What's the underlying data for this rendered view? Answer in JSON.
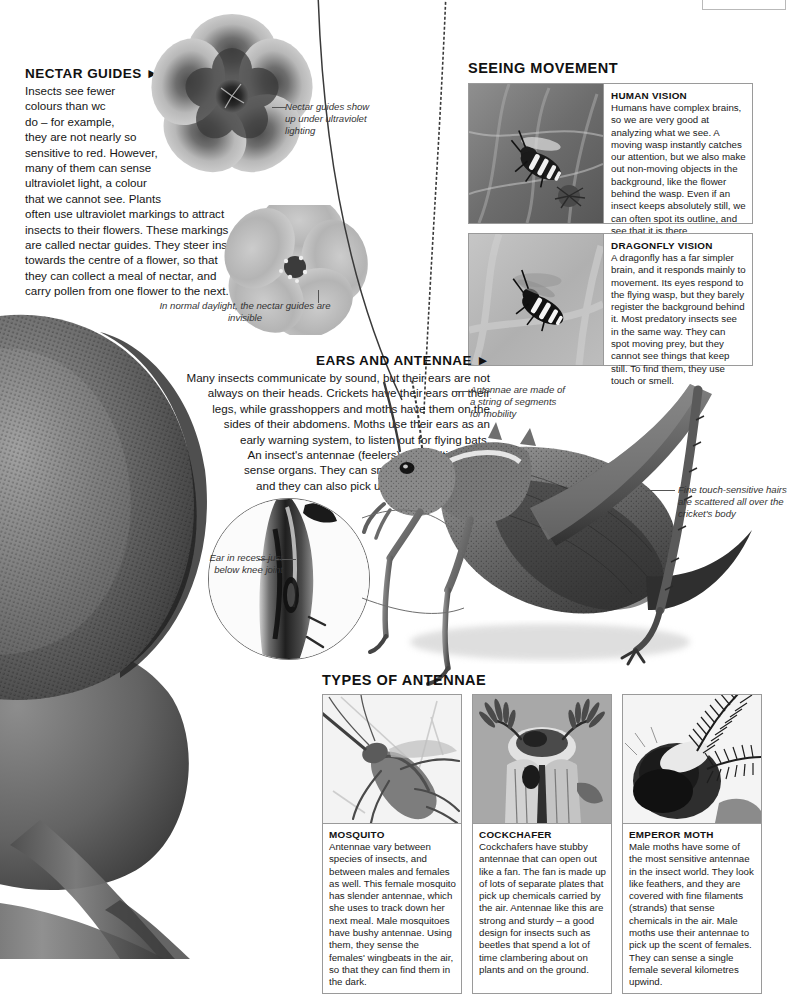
{
  "nectar_guides": {
    "heading": "NECTAR GUIDES ►",
    "body_lines": [
      "Insects see fewer",
      "colours than wc",
      "do – for example,",
      "they are not nearly so",
      "sensitive to red. However,",
      "many of them can sense",
      "ultraviolet light, a colour",
      "that we cannot see. Plants",
      "often use ultraviolet markings to attract",
      "insects to their flowers. These markings",
      "are called nectar guides. They steer insects",
      "towards the centre of a flower, so that",
      "they can collect a meal of nectar, and",
      "carry pollen from one flower to the next."
    ],
    "uv_caption": "Nectar guides show up under ultraviolet lighting",
    "daylight_caption": "In normal daylight, the nectar guides are invisible"
  },
  "seeing_movement": {
    "title": "SEEING MOVEMENT",
    "panels": [
      {
        "title": "HUMAN VISION",
        "photo_name": "wasp-on-plant-photo",
        "body": "Humans have complex brains, so we are very good at analyzing what we see. A moving wasp instantly catches our attention, but we also make out non-moving objects in the background, like the flower behind the wasp. Even if an insect keeps absolutely still, we can often spot its outline, and see that it is there."
      },
      {
        "title": "DRAGONFLY VISION",
        "photo_name": "wasp-blurred-background-photo",
        "body": "A dragonfly has a far simpler brain, and it responds mainly to movement. Its eyes respond to the flying wasp, but they barely register the background behind it. Most predatory insects see in the same way. They can spot moving prey, but they cannot see things that keep still. To find them, they use touch or smell."
      }
    ]
  },
  "ears_and_antennae": {
    "heading": "EARS AND ANTENNAE ►",
    "body_lines": [
      "Many insects communicate by sound, but their ears are not",
      "always on their heads. Crickets have their ears on their",
      "legs, while grasshoppers and moths have them on the",
      "sides of their abdomens. Moths use their ears as an",
      "early warning system, to listen out for flying bats.",
      "An insect's antennae (feelers) are multipurpose",
      "sense organs. They can smell, touch, and taste,",
      "and they can also pick up vibrations in the air."
    ]
  },
  "annotations": {
    "antennae_note": "Antennae are made of a string of segments for mobility",
    "hairs_note": "Fine touch-sensitive hairs are scattered all over the cricket's body",
    "ear_note": "Ear in recess just below knee joint"
  },
  "types_of_antennae": {
    "title": "TYPES OF ANTENNAE",
    "cards": [
      {
        "title": "MOSQUITO",
        "photo_name": "mosquito-head-photo",
        "body": "Antennae vary between species of insects, and between males and females as well. This female mosquito has slender antennae, which she uses to track down her next meal. Male mosquitoes have bushy antennae. Using them, they sense the females' wingbeats in the air, so that they can find them in the dark."
      },
      {
        "title": "COCKCHAFER",
        "photo_name": "cockchafer-head-photo",
        "body": "Cockchafers have stubby antennae that can open out like a fan. The fan is made up of lots of separate plates that pick up chemicals carried by the air. Antennae like this are strong and sturdy – a good design for insects such as beetles that spend a lot of time clambering about on plants and on the ground."
      },
      {
        "title": "EMPEROR MOTH",
        "photo_name": "emperor-moth-head-photo",
        "body": "Male moths have some of the most sensitive antennae in the insect world. They look like feathers, and they are covered with fine filaments (strands) that sense chemicals in the air. Male moths use their antennae to pick up the scent of females. They can sense a single female several kilometres upwind."
      }
    ]
  },
  "imagery": {
    "fly_eye_photo": "compound-eye-closeup-photo",
    "cricket_photo": "bush-cricket-photo",
    "ear_magnifier_photo": "cricket-leg-ear-closeup-photo",
    "uv_flower_photo": "flower-ultraviolet-photo",
    "daylight_flower_photo": "flower-daylight-photo"
  },
  "colors": {
    "page_background": "#ffffff",
    "text": "#111111",
    "panel_border": "#9a9a9a",
    "lead_line": "#555555",
    "photo_mid_gray": "#8a8a8a"
  }
}
